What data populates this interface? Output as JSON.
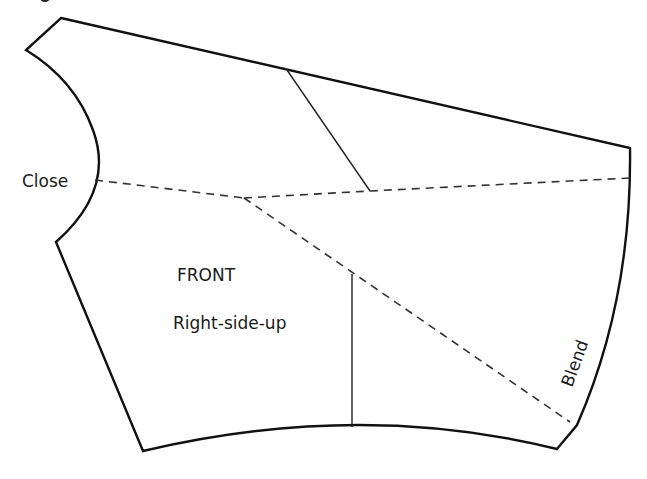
{
  "figure": {
    "title_fragment": "",
    "piece_name": "FRONT",
    "orientation_note": "Right-side-up",
    "labels": {
      "close": "Close",
      "blend": "Blend"
    },
    "colors": {
      "outline": "#111111",
      "background": "#ffffff"
    }
  }
}
